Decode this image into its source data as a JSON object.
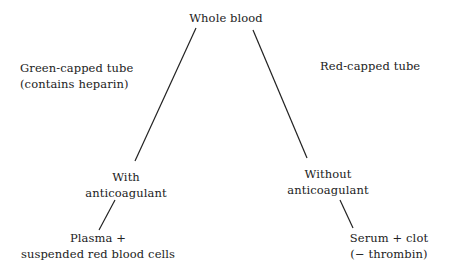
{
  "diagram": {
    "root": {
      "label": "Whole blood"
    },
    "left_branch": {
      "tube_label_line1": "Green-capped tube",
      "tube_label_line2": "(contains heparin)",
      "condition_line1": "With",
      "condition_line2": "anticoagulant",
      "result_line1": "Plasma +",
      "result_line2": "suspended red blood cells"
    },
    "right_branch": {
      "tube_label_line1": "Red-capped tube",
      "condition_line1": "Without",
      "condition_line2": "anticoagulant",
      "result_line1": "Serum + clot",
      "result_line2": "(− thrombin)"
    },
    "colors": {
      "text": "#222222",
      "line": "#222222",
      "background": "#ffffff"
    }
  }
}
